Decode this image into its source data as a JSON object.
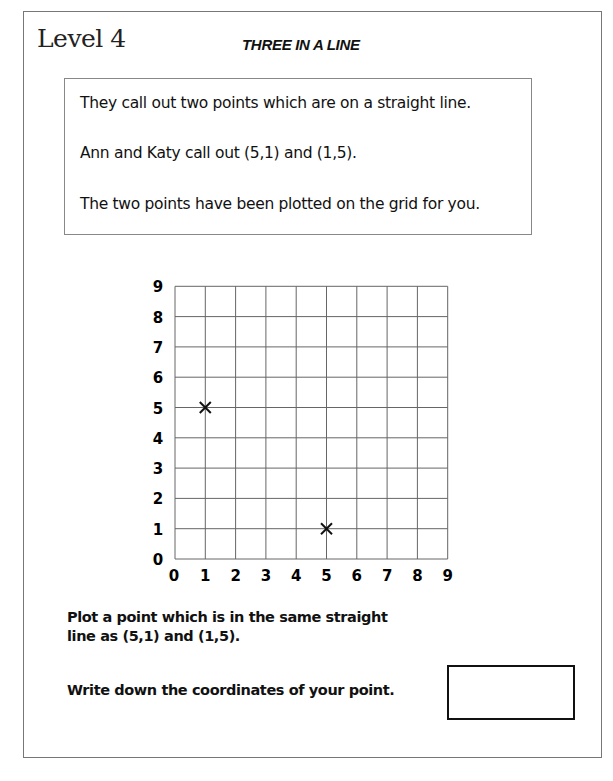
{
  "header": {
    "level": "Level 4",
    "title": "THREE IN A LINE"
  },
  "info": {
    "lines": [
      "They call out two points which are on a straight line.",
      "Ann and Katy call out (5,1) and (1,5).",
      "The two points have been plotted on the grid for you."
    ]
  },
  "questions": {
    "plot_line1": "Plot a point which is in the same straight",
    "plot_line2": "line as (5,1) and (1,5).",
    "write": "Write down the coordinates of your point.",
    "answer_value": ""
  },
  "chart_data": {
    "type": "scatter",
    "title": "",
    "xlabel": "",
    "ylabel": "",
    "x_ticks": [
      "0",
      "1",
      "2",
      "3",
      "4",
      "5",
      "6",
      "7",
      "8",
      "9"
    ],
    "y_ticks": [
      "0",
      "1",
      "2",
      "3",
      "4",
      "5",
      "6",
      "7",
      "8",
      "9"
    ],
    "xlim": [
      0,
      9
    ],
    "ylim": [
      0,
      9
    ],
    "grid": true,
    "marker": "x",
    "points": [
      {
        "x": 1,
        "y": 5
      },
      {
        "x": 5,
        "y": 1
      }
    ]
  }
}
